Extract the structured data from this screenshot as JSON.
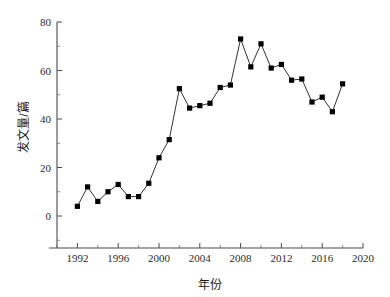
{
  "chart_data": {
    "type": "line",
    "title": "",
    "subtitle": "",
    "xlabel": "年份",
    "ylabel": "发文量/篇",
    "xlim": [
      1990,
      2020
    ],
    "ylim": [
      0,
      80
    ],
    "xticks": [
      1992,
      1996,
      2000,
      2004,
      2008,
      2012,
      2016,
      2020
    ],
    "xtick_labels": [
      "1992",
      "1996",
      "2000",
      "2004",
      "2008",
      "2012",
      "2016",
      "2020"
    ],
    "xticks_minor": [
      1994,
      1998,
      2002,
      2006,
      2010,
      2014,
      2018
    ],
    "yticks": [
      0,
      20,
      40,
      60,
      80
    ],
    "ytick_labels": [
      "0",
      "20",
      "40",
      "60",
      "80"
    ],
    "yticks_minor": [
      10,
      30,
      50,
      70
    ],
    "grid": false,
    "legend": false,
    "marker": "filled-square",
    "line_color": "#1c1c1c",
    "marker_color": "#000000",
    "x": [
      1992,
      1993,
      1994,
      1995,
      1996,
      1997,
      1998,
      1999,
      2000,
      2001,
      2002,
      2003,
      2004,
      2005,
      2006,
      2007,
      2008,
      2009,
      2010,
      2011,
      2012,
      2013,
      2014,
      2015,
      2016,
      2017,
      2018
    ],
    "values": [
      4,
      12,
      6,
      10,
      13,
      8,
      8,
      13.5,
      24,
      31.5,
      52.5,
      44.5,
      45.5,
      46.5,
      53,
      54,
      73,
      61.5,
      71,
      61,
      62.5,
      56,
      56.5,
      47,
      49,
      43,
      54.5
    ],
    "series": [
      {
        "name": "发文量",
        "values": [
          4,
          12,
          6,
          10,
          13,
          8,
          8,
          13.5,
          24,
          31.5,
          52.5,
          44.5,
          45.5,
          46.5,
          53,
          54,
          73,
          61.5,
          71,
          61,
          62.5,
          56,
          56.5,
          47,
          49,
          43,
          54.5
        ]
      }
    ],
    "annotations": []
  }
}
